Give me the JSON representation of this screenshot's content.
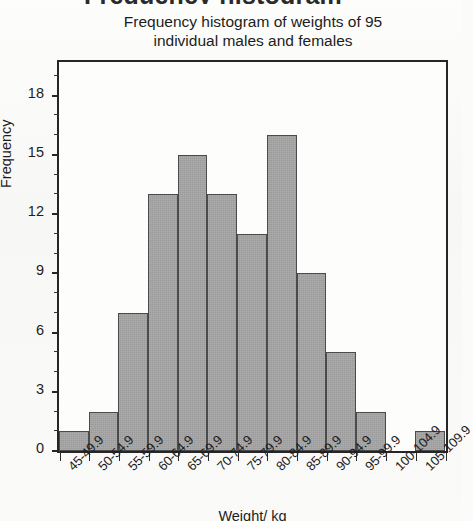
{
  "clipped_header_text": "Frequency histogram",
  "chart_data": {
    "type": "bar",
    "title": "Frequency histogram of weights of 95 individual males and females",
    "title_line1": "Frequency histogram of weights of 95",
    "title_line2": "individual males and females",
    "xlabel": "Weight/ kg",
    "ylabel": "Frequency",
    "categories": [
      "45-49.9",
      "50-54.9",
      "55-59.9",
      "60-64.9",
      "65-69.9",
      "70-74.9",
      "75-79.9",
      "80-84.9",
      "85-89.9",
      "90-94.9",
      "95-99.9",
      "100-104.9",
      "105-109.9"
    ],
    "values": [
      1,
      2,
      7,
      13,
      15,
      13,
      11,
      16,
      9,
      5,
      2,
      0,
      1
    ],
    "total": 95,
    "ylim": [
      0,
      19.65
    ],
    "ytick_labels": [
      "0",
      "3",
      "6",
      "9",
      "12",
      "15",
      "18"
    ],
    "ytick_values": [
      0,
      3,
      6,
      9,
      12,
      15,
      18
    ],
    "yminor_step": 1,
    "grid": false,
    "legend": "none",
    "bar_fill_color": "#9b9b9b",
    "bar_border_color": "#4b4b4b",
    "axis_color": "#262626",
    "background_color": "#fbfbfa"
  },
  "ghost_text": [
    "histogram of weights",
    "individual males",
    "and females"
  ]
}
